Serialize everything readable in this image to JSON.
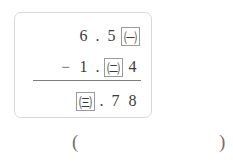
{
  "problem": {
    "type": "vertical-subtraction",
    "minuend": {
      "glyphs": [
        {
          "kind": "digit",
          "text": "6"
        },
        {
          "kind": "dot",
          "text": "."
        },
        {
          "kind": "digit",
          "text": "5"
        },
        {
          "kind": "blank",
          "text": "㈠"
        }
      ],
      "plain": "6.5㈠"
    },
    "subtrahend": {
      "operator": "−",
      "glyphs": [
        {
          "kind": "digit",
          "text": "1"
        },
        {
          "kind": "dot",
          "text": "."
        },
        {
          "kind": "blank",
          "text": "㈡"
        },
        {
          "kind": "digit",
          "text": "4"
        }
      ],
      "plain": "− 1.㈡4"
    },
    "result": {
      "glyphs": [
        {
          "kind": "blank",
          "text": "㈢"
        },
        {
          "kind": "dot",
          "text": "."
        },
        {
          "kind": "digit",
          "text": "7"
        },
        {
          "kind": "digit",
          "text": "8"
        }
      ],
      "plain": "㈢.78"
    },
    "blanks": [
      {
        "id": "blank-a",
        "label": "㈠"
      },
      {
        "id": "blank-b",
        "label": "㈡"
      },
      {
        "id": "blank-c",
        "label": "㈢"
      }
    ]
  },
  "answer": {
    "open_paren": "(",
    "close_paren": ")",
    "value": ""
  },
  "colors": {
    "frame_border": "#d8d8d8",
    "blank_box_border": "#9a9a9a",
    "rule": "#7d7d7d",
    "text": "#3c3c3c",
    "paren": "#6f6f6f",
    "background": "#ffffff"
  }
}
